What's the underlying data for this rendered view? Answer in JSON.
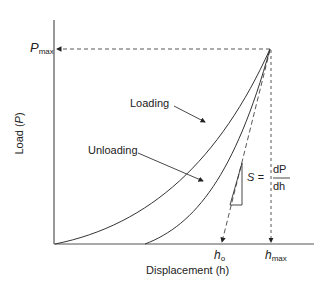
{
  "diagram": {
    "type": "load-displacement curve (nanoindentation)",
    "axes": {
      "y_label_prefix": "Load (",
      "y_label_var": "P",
      "y_label_suffix": ")",
      "x_label": "Displacement (h)"
    },
    "markers": {
      "p_max_main": "P",
      "p_max_sub": "max",
      "h_o_main": "h",
      "h_o_sub": "o",
      "h_max_main": "h",
      "h_max_sub": "max"
    },
    "curves": {
      "loading_label": "Loading",
      "unloading_label": "Unloading"
    },
    "stiffness": {
      "lhs": "S =",
      "numerator": "dP",
      "denominator": "dh"
    },
    "colors": {
      "line": "#333333",
      "axis": "#555555",
      "text": "#222222"
    }
  }
}
